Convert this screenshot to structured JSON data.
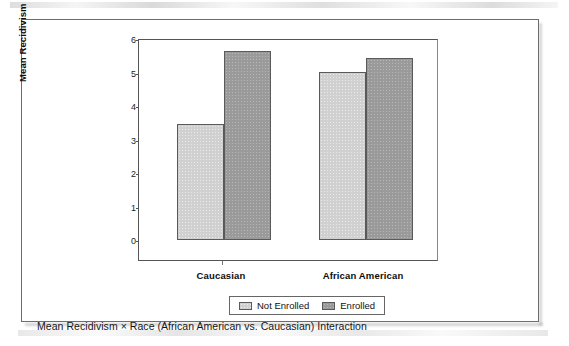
{
  "figure": {
    "caption": "Mean Recidivism × Race (African American vs. Caucasian) Interaction"
  },
  "chart_data": {
    "type": "bar",
    "title": "",
    "xlabel": "",
    "ylabel": "Mean Recidivism",
    "ylim": [
      0,
      6
    ],
    "yticks": [
      "0",
      "1",
      "2",
      "3",
      "4",
      "5",
      "6"
    ],
    "grid": false,
    "legend_position": "bottom-center",
    "categories": [
      "Caucasian",
      "African American"
    ],
    "series": [
      {
        "name": "Not Enrolled",
        "values": [
          3.47,
          5.02
        ],
        "color": "#d0d0d0"
      },
      {
        "name": "Enrolled",
        "values": [
          5.63,
          5.42
        ],
        "color": "#9a9a9a"
      }
    ]
  },
  "legend": {
    "items": [
      {
        "label": "Not Enrolled",
        "swatch": "light"
      },
      {
        "label": "Enrolled",
        "swatch": "dark"
      }
    ]
  },
  "axis": {
    "y_title": "Mean Recidivism",
    "y_ticks": [
      "6",
      "5",
      "4",
      "3",
      "2",
      "1",
      "0"
    ],
    "x_categories": [
      "Caucasian",
      "African American"
    ]
  },
  "colors": {
    "bar_light": "#d0d0d0",
    "bar_dark": "#9a9a9a",
    "frame": "#6d6d6d",
    "axis": "#555555",
    "text": "#111111"
  }
}
